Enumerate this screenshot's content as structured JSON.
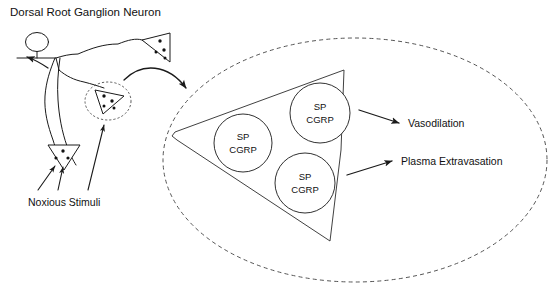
{
  "figure": {
    "title": "Dorsal Root Ganglion Neuron",
    "stimuli_label": "Noxious Stimuli",
    "outputs": [
      {
        "label": "Vasodilation"
      },
      {
        "label": "Plasma Extravasation"
      }
    ],
    "vesicles": [
      {
        "line1": "SP",
        "line2": "CGRP"
      },
      {
        "line1": "SP",
        "line2": "CGRP"
      },
      {
        "line1": "SP",
        "line2": "CGRP"
      }
    ],
    "colors": {
      "ink": "#111111",
      "line": "#1a1a1a",
      "dashed": "#555555",
      "background": "#ffffff"
    }
  }
}
